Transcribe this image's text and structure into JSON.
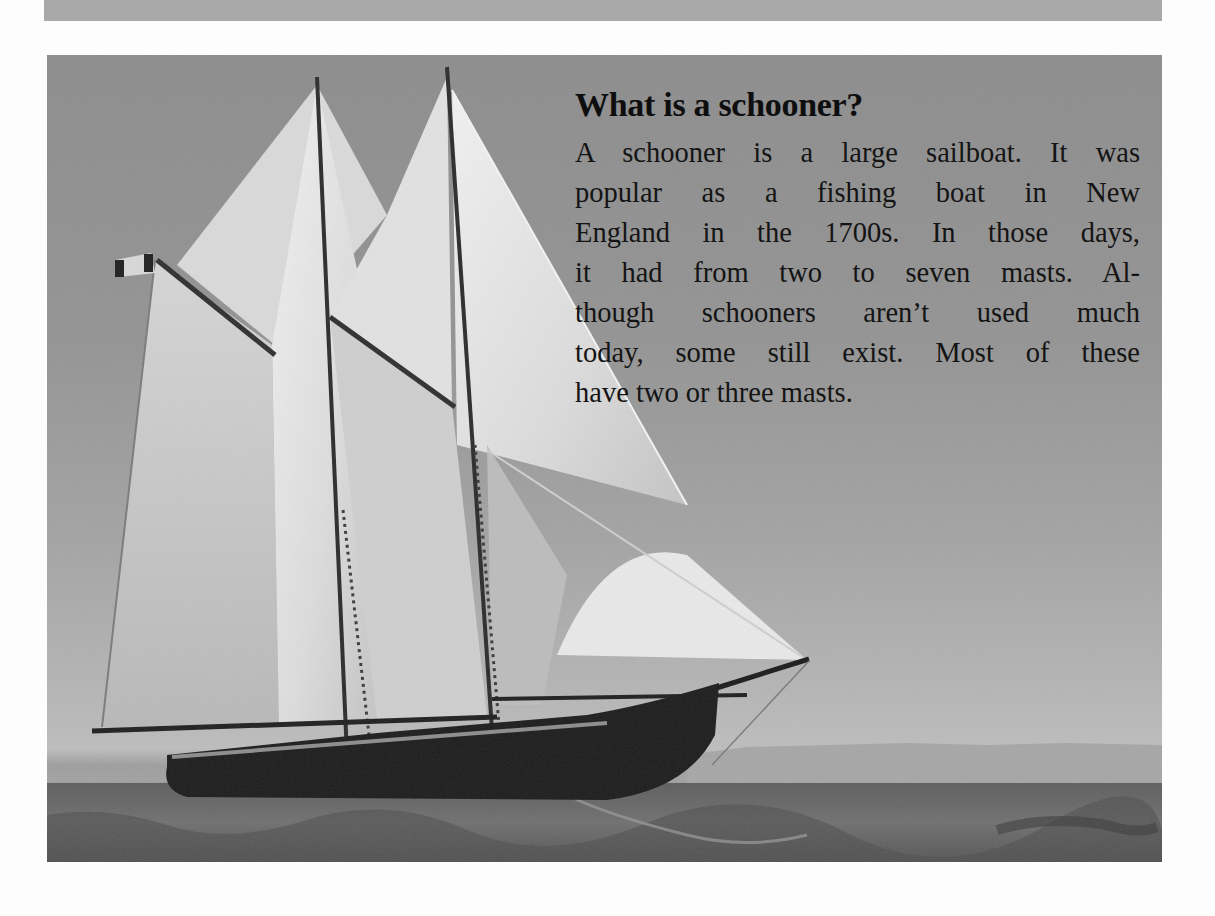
{
  "page": {
    "top_band_color": "#a9a9a9",
    "background_color": "#fdfdfd"
  },
  "photo": {
    "subject": "two-masted schooner under full sail on open sea",
    "icon": "schooner-photo",
    "tones": {
      "sky": "#939393",
      "sails": "#e6e6e6",
      "hull": "#1c1c1c",
      "sea": "#666666"
    }
  },
  "article": {
    "heading": "What is a schooner?",
    "body_lines": [
      "A schooner is a large sailboat. It was",
      "popular as a fishing boat in New",
      "England in the 1700s. In those days,",
      "it had from two to seven masts. Al-",
      "though schooners aren’t used much",
      "today, some still exist. Most of these",
      "have two or three masts."
    ],
    "body": "A schooner is a large sailboat. It was popular as a fishing boat in New England in the 1700s. In those days, it had from two to seven masts. Although schooners aren’t used much today, some still exist. Most of these have two or three masts."
  }
}
